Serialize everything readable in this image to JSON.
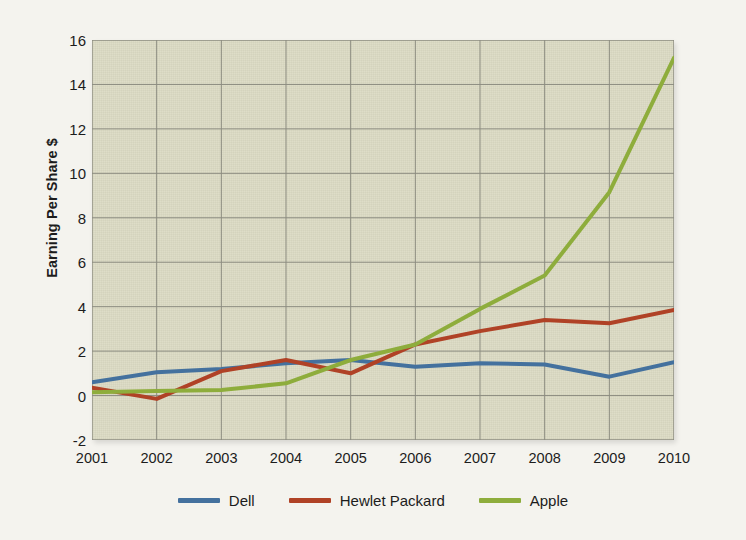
{
  "chart_data": {
    "type": "line",
    "title": "",
    "subtitle": "",
    "xlabel": "",
    "ylabel": "Earning Per Share $",
    "x": [
      2001,
      2002,
      2003,
      2004,
      2005,
      2006,
      2007,
      2008,
      2009,
      2010
    ],
    "categories": [
      "2001",
      "2002",
      "2003",
      "2004",
      "2005",
      "2006",
      "2007",
      "2008",
      "2009",
      "2010"
    ],
    "xlim": [
      2001,
      2010
    ],
    "ylim": [
      -2,
      16
    ],
    "y_ticks": [
      16,
      14,
      12,
      10,
      8,
      6,
      4,
      2,
      0,
      -2
    ],
    "y_tick_labels": [
      "16",
      "14",
      "12",
      "10",
      "8",
      "6",
      "4",
      "2",
      "0",
      "-2"
    ],
    "grid": true,
    "legend_position": "bottom",
    "series": [
      {
        "name": "Dell",
        "color": "#44719e",
        "values": [
          0.6,
          1.05,
          1.2,
          1.45,
          1.6,
          1.3,
          1.45,
          1.4,
          0.85,
          1.5
        ]
      },
      {
        "name": "Hewlet Packard",
        "color": "#b04226",
        "values": [
          0.35,
          -0.15,
          1.1,
          1.6,
          1.0,
          2.3,
          2.9,
          3.4,
          3.25,
          3.85
        ]
      },
      {
        "name": "Apple",
        "color": "#8ead3c",
        "values": [
          0.15,
          0.2,
          0.25,
          0.55,
          1.6,
          2.3,
          3.9,
          5.4,
          9.15,
          15.2
        ]
      }
    ]
  },
  "colors": {
    "page_background": "#f4f3ee",
    "plot_background": "#dcdbc4",
    "gridline": "#8c8c80",
    "axis_text": "#1c1c1c",
    "dell": "#44719e",
    "hewlet_packard": "#b04226",
    "apple": "#8ead3c"
  },
  "legend": {
    "items": [
      {
        "label": "Dell",
        "swatch": "dell-line-swatch"
      },
      {
        "label": "Hewlet Packard",
        "swatch": "hewlet-packard-line-swatch"
      },
      {
        "label": "Apple",
        "swatch": "apple-line-swatch"
      }
    ]
  }
}
